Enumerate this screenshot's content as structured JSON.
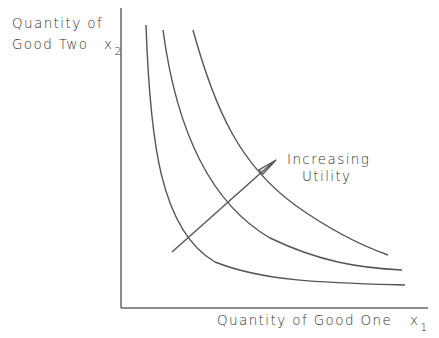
{
  "diagram": {
    "y_axis": {
      "label_line1": "Quantity of",
      "label_line2": "Good Two",
      "var": "x",
      "sub": "2"
    },
    "x_axis": {
      "label": "Quantity of Good One",
      "var": "x",
      "sub": "1"
    },
    "annotation": {
      "line1": "Increasing",
      "line2": "Utility"
    },
    "curves": [
      {
        "name": "indifference-curve-1",
        "start": [
          146,
          25
        ],
        "end": [
          405,
          285
        ]
      },
      {
        "name": "indifference-curve-2",
        "start": [
          163,
          30
        ],
        "end": [
          402,
          270
        ]
      },
      {
        "name": "indifference-curve-3",
        "start": [
          193,
          30
        ],
        "end": [
          388,
          255
        ]
      }
    ],
    "arrow": {
      "from": [
        172,
        252
      ],
      "to": [
        276,
        160
      ]
    },
    "line_color": "#555555"
  }
}
